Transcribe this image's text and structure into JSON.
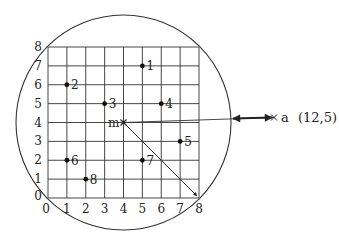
{
  "diagram": {
    "title": "",
    "grid": {
      "xmin": 0,
      "xmax": 8,
      "ymin": 0,
      "ymax": 8,
      "step": 1
    },
    "x_tick_labels": [
      "0",
      "1",
      "2",
      "3",
      "4",
      "5",
      "6",
      "7",
      "8"
    ],
    "y_tick_labels": [
      "0",
      "1",
      "2",
      "3",
      "4",
      "5",
      "6",
      "7",
      "8"
    ],
    "points": [
      {
        "label": "1",
        "x": 5,
        "y": 7
      },
      {
        "label": "2",
        "x": 1,
        "y": 6
      },
      {
        "label": "3",
        "x": 3,
        "y": 5
      },
      {
        "label": "4",
        "x": 6,
        "y": 5
      },
      {
        "label": "5",
        "x": 7,
        "y": 3
      },
      {
        "label": "6",
        "x": 1,
        "y": 2
      },
      {
        "label": "7",
        "x": 5,
        "y": 2
      },
      {
        "label": "8",
        "x": 2,
        "y": 1
      }
    ],
    "center_point": {
      "label": "m",
      "x": 4,
      "y": 4,
      "marker": "cross"
    },
    "radius_endpoint": {
      "x": 8,
      "y": 0
    },
    "circle": {
      "center_x": 4,
      "center_y": 4,
      "radius_units": 5.657
    },
    "query_point": {
      "label": "a",
      "coords_text": "(12,5)",
      "x": 12,
      "y": 5,
      "marker": "cross"
    },
    "distance_arrow": {
      "style": "double-headed",
      "from": "circle-edge",
      "to": "query-point"
    },
    "colors": {
      "line": "#333333",
      "grid": "#333333",
      "text": "#222222",
      "background": "#ffffff"
    }
  }
}
